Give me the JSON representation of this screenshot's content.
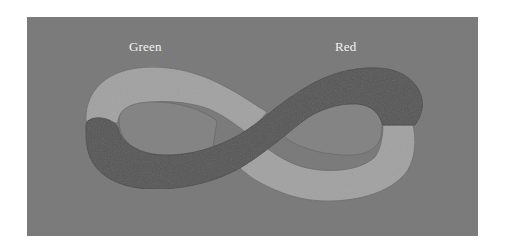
{
  "figure": {
    "labels": {
      "left": "Green",
      "right": "Red"
    },
    "colors": {
      "page_background": "#ffffff",
      "panel_background": "#7b7b7b",
      "light_band": "#a2a2a2",
      "dark_band": "#575757",
      "inner_hole": "#848484",
      "label_text": "#f4f4f4"
    },
    "shape": "infinity-loop band with two-tone coloring (light and dark segments crossing at center)"
  }
}
